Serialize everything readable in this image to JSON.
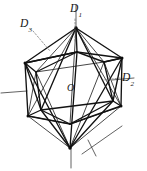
{
  "figure": {
    "shape_name": "icosahedron",
    "center_label": "O",
    "stroke_color": "#1a1a1a",
    "axis_color": "#2b2b2b",
    "leader_color": "#555555",
    "background_color": "#ffffff",
    "labels": {
      "d1": {
        "base": "D",
        "sub": "1",
        "meaning": "five-fold-axis"
      },
      "d2": {
        "base": "D",
        "sub": "2",
        "meaning": "two-fold-axis"
      },
      "d3": {
        "base": "D",
        "sub": "3",
        "meaning": "three-fold-axis"
      }
    },
    "geometry": {
      "apex": [
        76,
        28
      ],
      "nadir": [
        70,
        148
      ],
      "upper_ring": [
        [
          76,
          28
        ],
        [
          122,
          57
        ],
        [
          112,
          102
        ],
        [
          40,
          110
        ],
        [
          25,
          63
        ]
      ],
      "upper_pentagon": [
        [
          77,
          52
        ],
        [
          122,
          58
        ],
        [
          113,
          101
        ],
        [
          41,
          110
        ],
        [
          25,
          63
        ]
      ],
      "lower_pentagon": [
        [
          70,
          124
        ],
        [
          28,
          116
        ],
        [
          36,
          72
        ],
        [
          104,
          62
        ],
        [
          121,
          106
        ]
      ]
    },
    "axes": [
      {
        "name": "five-fold-vertical",
        "x1": 76,
        "y1": 6,
        "x2": 76,
        "y2": 28
      },
      {
        "name": "five-fold-vertical-lower",
        "x1": 70,
        "y1": 148,
        "x2": 70,
        "y2": 168
      },
      {
        "name": "two-fold-left-stub",
        "x1": 2,
        "y1": 92,
        "x2": 26,
        "y2": 90
      },
      {
        "name": "two-fold-lower-right",
        "x1": 84,
        "y1": 152,
        "x2": 120,
        "y2": 128
      },
      {
        "name": "two-fold-right-stub",
        "x1": 113,
        "y1": 80,
        "x2": 131,
        "y2": 78
      }
    ],
    "leaders": [
      {
        "name": "d3-leader",
        "x1": 34,
        "y1": 30,
        "x2": 49,
        "y2": 49
      },
      {
        "name": "d1-leader",
        "x1": 75,
        "y1": 18,
        "x2": 75,
        "y2": 41
      },
      {
        "name": "d2-leader",
        "x1": 121,
        "y1": 78,
        "x2": 104,
        "y2": 80
      }
    ]
  }
}
